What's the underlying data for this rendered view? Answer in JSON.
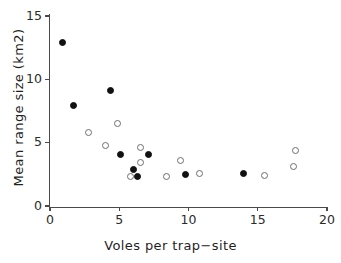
{
  "figure": {
    "clipped_top_text": "",
    "background": "#ffffff"
  },
  "axes": {
    "x": {
      "label": "Voles per trap−site",
      "ticks": [
        0,
        5,
        10,
        15,
        20
      ],
      "tick_labels": [
        "0",
        "5",
        "10",
        "15",
        "20"
      ],
      "min": 0,
      "max": 20
    },
    "y": {
      "label": "Mean range size (km2)",
      "ticks": [
        0,
        5,
        10,
        15
      ],
      "tick_labels": [
        "0",
        "5",
        "10",
        "15"
      ],
      "min": 0,
      "max": 15
    }
  },
  "chart_data": {
    "type": "scatter",
    "title": "",
    "xlabel": "Voles per trap−site",
    "ylabel": "Mean range size (km2)",
    "xlim": [
      0,
      20
    ],
    "ylim": [
      0,
      15
    ],
    "grid": false,
    "legend": "none",
    "series": [
      {
        "name": "filled",
        "marker": "filled-circle",
        "color": "#111111",
        "points": [
          {
            "x": 0.9,
            "y": 12.9
          },
          {
            "x": 1.7,
            "y": 7.9
          },
          {
            "x": 4.4,
            "y": 9.1
          },
          {
            "x": 5.1,
            "y": 4.1
          },
          {
            "x": 6.0,
            "y": 2.9
          },
          {
            "x": 6.3,
            "y": 2.3
          },
          {
            "x": 7.1,
            "y": 4.1
          },
          {
            "x": 9.8,
            "y": 2.5
          },
          {
            "x": 14.0,
            "y": 2.6
          }
        ]
      },
      {
        "name": "open",
        "marker": "open-circle",
        "color": "#6e6e6e",
        "points": [
          {
            "x": 2.8,
            "y": 5.8
          },
          {
            "x": 4.0,
            "y": 4.8
          },
          {
            "x": 4.9,
            "y": 6.5
          },
          {
            "x": 5.8,
            "y": 2.3
          },
          {
            "x": 6.5,
            "y": 4.6
          },
          {
            "x": 6.5,
            "y": 3.4
          },
          {
            "x": 8.4,
            "y": 2.3
          },
          {
            "x": 9.4,
            "y": 3.6
          },
          {
            "x": 10.8,
            "y": 2.6
          },
          {
            "x": 15.5,
            "y": 2.4
          },
          {
            "x": 17.7,
            "y": 4.4
          },
          {
            "x": 17.6,
            "y": 3.1
          }
        ]
      }
    ]
  }
}
